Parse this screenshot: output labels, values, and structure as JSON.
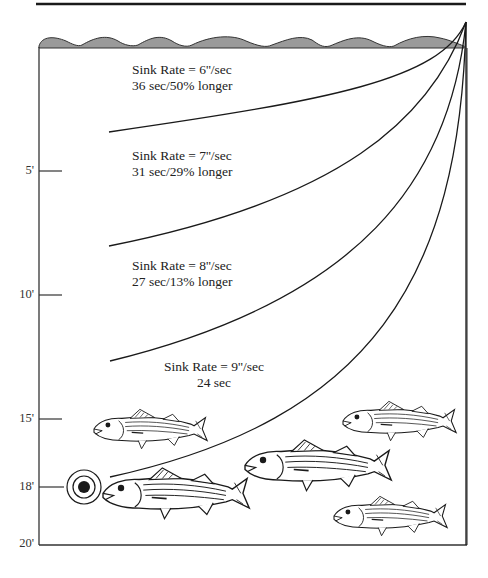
{
  "diagram": {
    "type": "sink-rate depth diagram",
    "depth_axis": {
      "ticks": [
        {
          "label": "5'",
          "depth_ft": 5
        },
        {
          "label": "10'",
          "depth_ft": 10
        },
        {
          "label": "15'",
          "depth_ft": 15
        },
        {
          "label": "18'",
          "depth_ft": 18
        },
        {
          "label": "20'",
          "depth_ft": 20
        }
      ]
    },
    "curves": [
      {
        "sink_rate_label": "Sink Rate = 6''/sec",
        "time_label": "36 sec/50% longer",
        "sink_rate_in_per_sec": 6,
        "time_sec": 36,
        "percent_longer": 50
      },
      {
        "sink_rate_label": "Sink Rate = 7''/sec",
        "time_label": "31 sec/29% longer",
        "sink_rate_in_per_sec": 7,
        "time_sec": 31,
        "percent_longer": 29
      },
      {
        "sink_rate_label": "Sink Rate = 8''/sec",
        "time_label": "27 sec/13% longer",
        "sink_rate_in_per_sec": 8,
        "time_sec": 27,
        "percent_longer": 13
      },
      {
        "sink_rate_label": "Sink Rate = 9''/sec",
        "time_label": "24 sec",
        "sink_rate_in_per_sec": 9,
        "time_sec": 24,
        "percent_longer": 0
      }
    ],
    "target": {
      "depth_ft": 18,
      "icon": "bullseye-target"
    },
    "fish": [
      {
        "name": "striped-bass",
        "size": "small"
      },
      {
        "name": "striped-bass",
        "size": "large"
      },
      {
        "name": "striped-bass",
        "size": "small"
      },
      {
        "name": "striped-bass",
        "size": "large"
      },
      {
        "name": "striped-bass",
        "size": "small"
      }
    ],
    "colors": {
      "line": "#1a1a1a",
      "water_surface": "#9a9a9a",
      "background": "#ffffff"
    }
  }
}
